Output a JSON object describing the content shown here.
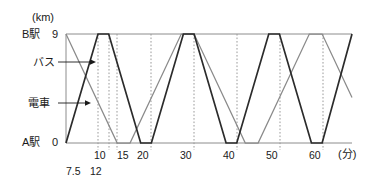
{
  "figure": {
    "y_unit_label": "(km)",
    "x_unit_label": "(分)",
    "y_axis": {
      "top_station_label": "B駅",
      "top_value_label": "9",
      "bottom_station_label": "A駅",
      "bottom_value_label": "0"
    },
    "series_labels": {
      "bus": "バス",
      "train": "電車"
    },
    "x_ticks_main": [
      "10",
      "15",
      "20",
      "30",
      "40",
      "50",
      "60"
    ],
    "x_ticks_lower": [
      "7.5",
      "12"
    ],
    "colors": {
      "train": "#2b2b2b",
      "bus": "#8a8a8a",
      "axis": "#8c8c8c",
      "grid": "#9a9a9a",
      "text": "#1a1a1a",
      "background": "#ffffff"
    }
  },
  "chart_data": {
    "type": "line",
    "title": "",
    "xlabel": "(分)",
    "ylabel": "(km)",
    "xlim": [
      0,
      67
    ],
    "ylim": [
      0,
      9
    ],
    "grid": true,
    "grid_axis": "x",
    "grid_style": "dotted",
    "gridlines_x": [
      7.5,
      10,
      12,
      20,
      30,
      40,
      50,
      60
    ],
    "xticks": [
      7.5,
      10,
      12,
      15,
      20,
      30,
      40,
      50,
      60
    ],
    "xticklabels": [
      "7.5",
      "10",
      "12",
      "15",
      "20",
      "30",
      "40",
      "50",
      "60"
    ],
    "yticks": [
      0,
      9
    ],
    "yticklabels": [
      "0",
      "9"
    ],
    "ytick_station_names": [
      "A駅",
      "B駅"
    ],
    "legend": "inline-annotation",
    "annotations": [
      {
        "text": "バス",
        "points_to_series": "bus",
        "x": 4.5,
        "y": 7.2
      },
      {
        "text": "電車",
        "points_to_series": "train",
        "x": 4.0,
        "y": 3.0
      }
    ],
    "series": [
      {
        "name": "電車",
        "name_en": "train",
        "color": "#2b2b2b",
        "width": 1.7,
        "travel_time_min": 7.5,
        "stop_time_min": 2.5,
        "period_min": 20,
        "start_station": "A駅",
        "x": [
          0,
          7.5,
          10,
          17.5,
          20,
          27.5,
          30,
          37.5,
          40,
          47.5,
          50,
          57.5,
          60,
          67
        ],
        "y": [
          0,
          9,
          9,
          0,
          0,
          9,
          9,
          0,
          0,
          9,
          9,
          0,
          0,
          9
        ]
      },
      {
        "name": "バス",
        "name_en": "bus",
        "color": "#8a8a8a",
        "width": 1.25,
        "travel_time_min": 12,
        "stop_time_min": 3,
        "period_min": 30,
        "start_station": "B駅",
        "x": [
          0,
          12,
          15,
          27,
          30,
          42,
          45,
          57,
          60,
          67
        ],
        "y": [
          9,
          0,
          0,
          9,
          9,
          0,
          0,
          9,
          9,
          3.75
        ]
      }
    ]
  }
}
